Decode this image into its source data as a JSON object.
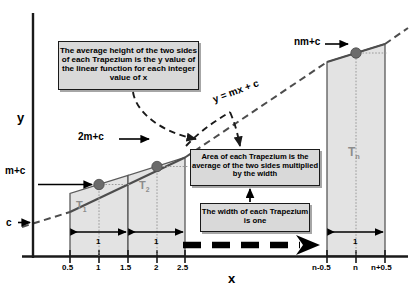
{
  "diagram": {
    "axes": {
      "y_label": "y",
      "x_label": "x",
      "x_ticks": [
        "0.5",
        "1",
        "1.5",
        "2",
        "2.5",
        "n-0.5",
        "n",
        "n+0.5"
      ],
      "y_intercept_label": "c"
    },
    "function_label": "y = mx + c",
    "point_labels": {
      "first": "m+c",
      "second": "2m+c",
      "last": "nm+c"
    },
    "trapezium_labels": {
      "first": "T",
      "first_sub": "1",
      "second": "T",
      "second_sub": "2",
      "last": "T",
      "last_sub": "n"
    },
    "width_labels": [
      "1",
      "1",
      "1"
    ],
    "callouts": {
      "average_height": "The average height of the two sides of each Trapezium is the y value of the linear function for each integer value of x",
      "area": "Area of each Trapezium is the average of the two sides multiplied by the width",
      "width": "The width of each Trapezium is one"
    },
    "colors": {
      "axis": "#1a1a1a",
      "line": "#4d4d4d",
      "trapezium_fill": "#e3e3e3",
      "trapezium_stroke": "#5a5a5a",
      "dot": "#6b6b6b",
      "callout_bg": "#d9d9d9",
      "callout_border": "#1a1a1a",
      "label_gray": "#8c8c8c"
    }
  }
}
